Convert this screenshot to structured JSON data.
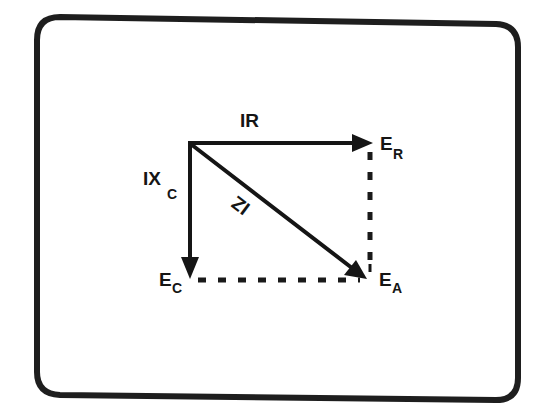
{
  "diagram": {
    "type": "phasor-diagram",
    "colors": {
      "ink": "#151515",
      "background": "#ffffff",
      "frame": "#1e1e1e"
    },
    "vectors": [
      {
        "id": "IR",
        "label": "IR",
        "direction": "right",
        "endpoint_label": {
          "main": "E",
          "sub": "R"
        }
      },
      {
        "id": "IXC",
        "label_main": "IX",
        "label_sub": "C",
        "direction": "down",
        "endpoint_label": {
          "main": "E",
          "sub": "C"
        }
      },
      {
        "id": "IZ",
        "label": "IZ",
        "direction": "diagonal-down-right",
        "endpoint_label": {
          "main": "E",
          "sub": "A"
        }
      }
    ],
    "labels": {
      "ir": "IR",
      "ixc_main": "IX",
      "ixc_sub": "C",
      "iz": "IZ",
      "er_main": "E",
      "er_sub": "R",
      "ec_main": "E",
      "ec_sub": "C",
      "ea_main": "E",
      "ea_sub": "A"
    },
    "dashed_lines": [
      {
        "from": "E_R",
        "to": "E_A",
        "orientation": "vertical"
      },
      {
        "from": "E_C",
        "to": "E_A",
        "orientation": "horizontal"
      }
    ]
  }
}
